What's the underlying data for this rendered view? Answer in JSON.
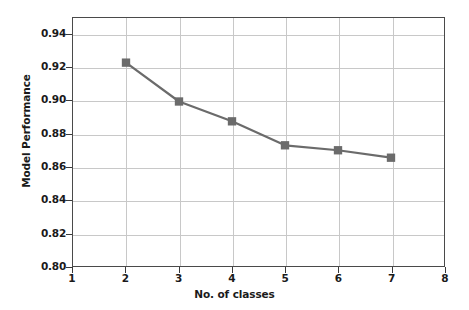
{
  "chart_data": {
    "type": "line",
    "title": "",
    "xlabel": "No. of classes",
    "ylabel": "Model Performance",
    "x": [
      2,
      3,
      4,
      5,
      6,
      7
    ],
    "values": [
      0.923,
      0.8995,
      0.8875,
      0.873,
      0.87,
      0.8655
    ],
    "series": [
      {
        "name": "Model Performance",
        "x": [
          2,
          3,
          4,
          5,
          6,
          7
        ],
        "values": [
          0.923,
          0.8995,
          0.8875,
          0.873,
          0.87,
          0.8655
        ]
      }
    ],
    "xlim": [
      1,
      8
    ],
    "ylim": [
      0.8,
      0.95
    ],
    "xticks": [
      1,
      2,
      3,
      4,
      5,
      6,
      7,
      8
    ],
    "xtick_labels": [
      "1",
      "2",
      "3",
      "4",
      "5",
      "6",
      "7",
      "8"
    ],
    "yticks": [
      0.8,
      0.82,
      0.84,
      0.86,
      0.88,
      0.9,
      0.92,
      0.94
    ],
    "ytick_labels": [
      "0.80",
      "0.82",
      "0.84",
      "0.86",
      "0.88",
      "0.90",
      "0.92",
      "0.94"
    ],
    "grid": true,
    "legend": null,
    "line_color": "#6b6b6b",
    "marker_color": "#6b6b6b",
    "marker": "square",
    "grid_color": "#c8c8c8",
    "frame_color": "#4a4a4a",
    "background_color": "#ffffff"
  }
}
